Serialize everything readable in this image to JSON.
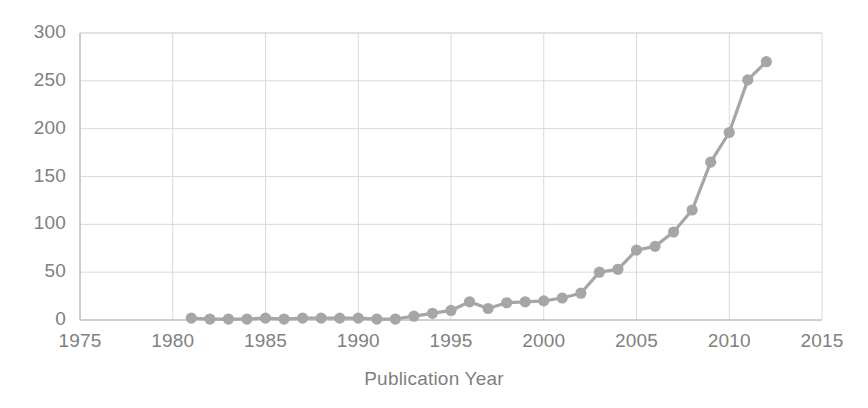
{
  "chart_data": {
    "type": "line",
    "title": "",
    "subtitle": "",
    "xlabel": "Publication Year",
    "ylabel": "",
    "xlim": [
      1975,
      2015
    ],
    "ylim": [
      0,
      300
    ],
    "xticks": [
      1975,
      1980,
      1985,
      1990,
      1995,
      2000,
      2005,
      2010,
      2015
    ],
    "yticks": [
      0,
      50,
      100,
      150,
      200,
      250,
      300
    ],
    "grid": true,
    "legend": null,
    "legend_position": "none",
    "series_color": "#a6a6a6",
    "marker": "circle",
    "x": [
      1981,
      1982,
      1983,
      1984,
      1985,
      1986,
      1987,
      1988,
      1989,
      1990,
      1991,
      1992,
      1993,
      1994,
      1995,
      1996,
      1997,
      1998,
      1999,
      2000,
      2001,
      2002,
      2003,
      2004,
      2005,
      2006,
      2007,
      2008,
      2009,
      2010,
      2011,
      2012
    ],
    "series": [
      {
        "name": "Publications",
        "values": [
          2,
          1,
          1,
          1,
          2,
          1,
          2,
          2,
          2,
          2,
          1,
          1,
          4,
          7,
          10,
          19,
          12,
          18,
          19,
          20,
          23,
          28,
          50,
          53,
          73,
          77,
          92,
          115,
          165,
          196,
          251,
          270
        ]
      }
    ]
  },
  "axis": {
    "x_title": "Publication Year",
    "x_tick_labels": [
      "1975",
      "1980",
      "1985",
      "1990",
      "1995",
      "2000",
      "2005",
      "2010",
      "2015"
    ],
    "y_tick_labels": [
      "0",
      "50",
      "100",
      "150",
      "200",
      "250",
      "300"
    ]
  },
  "style": {
    "background": "#ffffff",
    "grid_color": "#d9d9d9",
    "axis_color": "#bfbfbf",
    "text_color": "#808080",
    "series_color": "#a6a6a6"
  }
}
